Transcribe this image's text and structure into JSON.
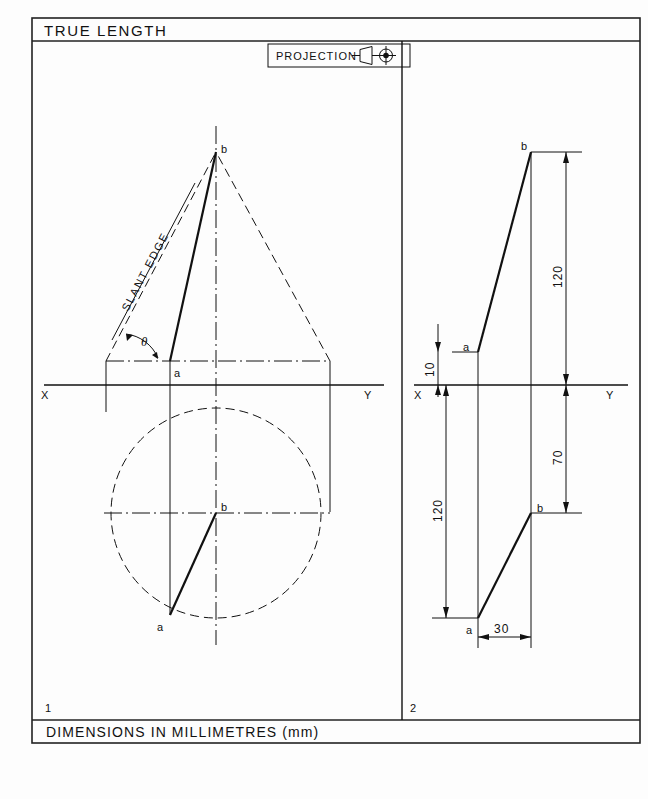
{
  "sheet": {
    "title": "TRUE LENGTH",
    "footer": "DIMENSIONS IN MILLIMETRES (mm)",
    "projection_label": "PROJECTION",
    "projection_symbol_name": "first-angle-projection-symbol"
  },
  "views": [
    {
      "number": "1",
      "name": "cone-true-length-view",
      "labels": {
        "apex": "b",
        "base_point": "a",
        "plan_center": "b",
        "plan_point": "a",
        "slant_edge": "SLANT EDGE",
        "angle": "θ",
        "x": "X",
        "y": "Y"
      }
    },
    {
      "number": "2",
      "name": "line-true-length-view",
      "labels": {
        "top_point": "b",
        "upper_point": "a",
        "lower_point": "b",
        "bottom_point": "a",
        "x": "X",
        "y": "Y"
      },
      "dimensions": [
        {
          "name": "height-above-xy",
          "value": "120"
        },
        {
          "name": "offset-above-xy",
          "value": "10"
        },
        {
          "name": "depth-to-b",
          "value": "70"
        },
        {
          "name": "depth-to-a",
          "value": "120"
        },
        {
          "name": "horizontal-offset",
          "value": "30"
        }
      ]
    }
  ],
  "colors": {
    "ink": "#111111",
    "paper": "#fdfdfd",
    "frame": "#222222"
  }
}
